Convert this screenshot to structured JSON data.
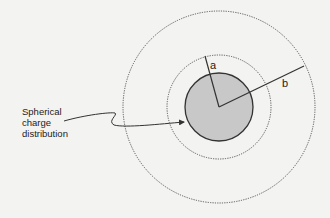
{
  "diagram": {
    "labels": {
      "radius_a": "a",
      "radius_b": "b",
      "caption_line1": "Spherical",
      "caption_line2": "charge",
      "caption_line3": "distribution"
    },
    "colors": {
      "background": "#f3f3f1",
      "sphere_fill": "#c8c8c8",
      "stroke": "#333333"
    }
  }
}
